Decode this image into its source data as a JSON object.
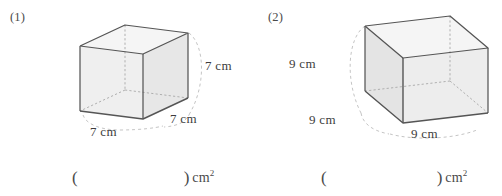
{
  "page": {
    "kind": "math-worksheet",
    "topic": "surface-area-of-cube",
    "background": "#ffffff",
    "ink_color": "#3a3a3a"
  },
  "style": {
    "edge_color": "#555555",
    "hidden_edge_color": "#9a9a9a",
    "arc_color": "#b5b5b5",
    "face_light": "#f4f4f4",
    "face_mid": "#ececec",
    "face_dark": "#e3e3e3"
  },
  "problems": [
    {
      "number": "(1)",
      "shape": "cube",
      "orientation": "depth-to-right",
      "labels": {
        "height": "7 cm",
        "width": "7 cm",
        "depth": "7 cm"
      },
      "answer": {
        "open_paren": "(",
        "value": "",
        "close_paren": ")",
        "unit": "cm",
        "unit_exponent": "2"
      }
    },
    {
      "number": "(2)",
      "shape": "cube",
      "orientation": "depth-to-left",
      "labels": {
        "height": "9 cm",
        "width": "9 cm",
        "depth": "9 cm"
      },
      "answer": {
        "open_paren": "(",
        "value": "",
        "close_paren": ")",
        "unit": "cm",
        "unit_exponent": "2"
      }
    }
  ]
}
